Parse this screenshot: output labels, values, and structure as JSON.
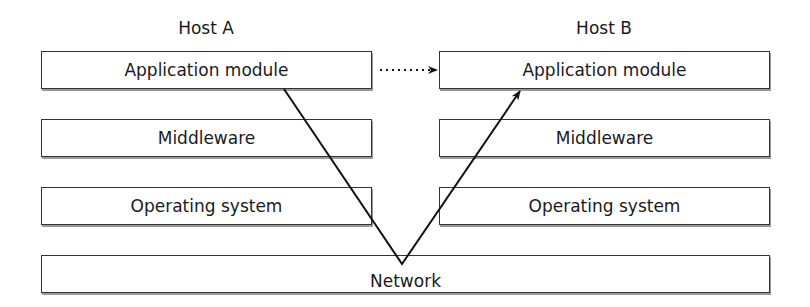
{
  "hosts": [
    {
      "label": "Host A",
      "layers": [
        "Application module",
        "Middleware",
        "Operating system"
      ]
    },
    {
      "label": "Host B",
      "layers": [
        "Application module",
        "Middleware",
        "Operating system"
      ]
    }
  ],
  "network": {
    "label": "Network"
  },
  "connections": [
    {
      "type": "dotted-arrow",
      "from": "Host A Application module",
      "to": "Host B Application module"
    },
    {
      "type": "solid-arrow",
      "path": [
        "Host A Application module",
        "Network",
        "Host B Application module"
      ]
    }
  ]
}
